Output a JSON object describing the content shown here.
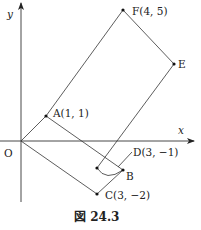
{
  "figure": {
    "caption": "図 24.3",
    "axes": {
      "x_label": "x",
      "y_label": "y",
      "origin_label": "O"
    },
    "points": {
      "A": {
        "label": "A(1, 1)",
        "coord": [
          1,
          1
        ]
      },
      "B": {
        "label": "B"
      },
      "C": {
        "label": "C(3, −2)",
        "coord": [
          3,
          -2
        ]
      },
      "D": {
        "label": "D(3, −1)",
        "coord": [
          3,
          -1
        ]
      },
      "E": {
        "label": "E"
      },
      "F": {
        "label": "F(4, 5)",
        "coord": [
          4,
          5
        ]
      }
    },
    "segments": [
      "O-A",
      "A-F",
      "F-E",
      "E-D",
      "A-B",
      "O-C",
      "C-B"
    ],
    "curves": [
      "D~B arc"
    ]
  }
}
